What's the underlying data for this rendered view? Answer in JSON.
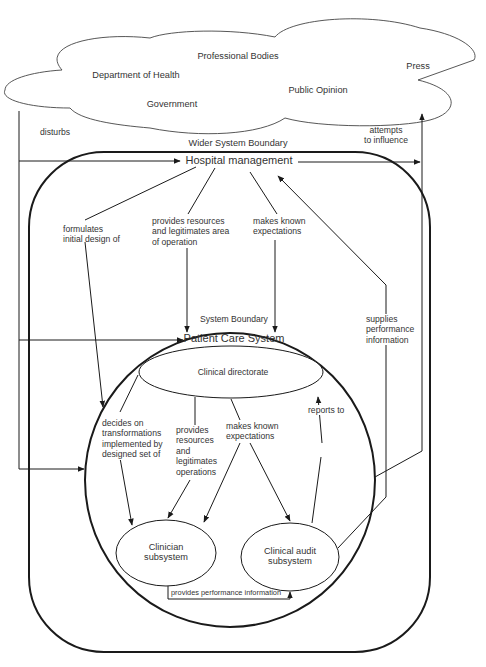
{
  "environment": {
    "cloud_labels": [
      "Professional Bodies",
      "Department of Health",
      "Press",
      "Public Opinion",
      "Government"
    ]
  },
  "edges_outer": {
    "disturbs": "disturbs",
    "attempts_to_influence": [
      "attempts",
      "to influence"
    ],
    "wider_system_boundary": "Wider System Boundary"
  },
  "hospital": {
    "title": "Hospital management",
    "formulates": [
      "formulates",
      "initial design of"
    ],
    "provides_resources": [
      "provides resources",
      "and legitimates area",
      "of operation"
    ],
    "makes_known": [
      "makes known",
      "expectations"
    ],
    "supplies_performance": [
      "supplies",
      "performance",
      "information"
    ]
  },
  "patient_care": {
    "system_boundary": "System Boundary",
    "title": "Patient Care System",
    "clinical_directorate": "Clinical directorate",
    "decides_on": [
      "decides on",
      "transformations",
      "implemented by",
      "designed set of"
    ],
    "provides": [
      "provides",
      "resources",
      "and",
      "legitimates",
      "operations"
    ],
    "makes_known": [
      "makes known",
      "expectations"
    ],
    "reports_to": "reports to",
    "clinician_subsystem": [
      "Clinician",
      "subsystem"
    ],
    "clinical_audit_subsystem": [
      "Clinical audit",
      "subsystem"
    ],
    "provides_performance_information": "provides performance information"
  },
  "colors": {
    "stroke": "#1a1a1a",
    "text": "#333333",
    "background": "#ffffff"
  }
}
